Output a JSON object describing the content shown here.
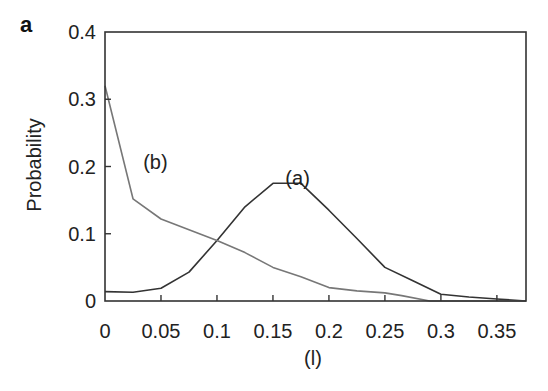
{
  "panel_label": "a",
  "chart_data": {
    "type": "line",
    "title": "",
    "panel": "a",
    "xlabel": "(l)",
    "ylabel": "Probability",
    "xlim": [
      0,
      0.376
    ],
    "ylim": [
      0,
      0.4
    ],
    "xticks": [
      0,
      0.05,
      0.1,
      0.15,
      0.2,
      0.25,
      0.3,
      0.35
    ],
    "xtick_labels": [
      "0",
      "0.05",
      "0.1",
      "0.15",
      "0.2",
      "0.25",
      "0.3",
      "0.35"
    ],
    "yticks": [
      0,
      0.1,
      0.2,
      0.3,
      0.4
    ],
    "ytick_labels": [
      "0",
      "0.1",
      "0.2",
      "0.3",
      "0.4"
    ],
    "grid": false,
    "legend": "none",
    "series": [
      {
        "name": "(a)",
        "color": "#333333",
        "label_pos": [
          0.172,
          0.183
        ],
        "x": [
          0,
          0.025,
          0.05,
          0.075,
          0.1,
          0.125,
          0.15,
          0.175,
          0.2,
          0.225,
          0.25,
          0.275,
          0.3,
          0.325,
          0.35,
          0.376
        ],
        "y": [
          0.014,
          0.013,
          0.019,
          0.043,
          0.09,
          0.14,
          0.175,
          0.175,
          0.135,
          0.093,
          0.05,
          0.03,
          0.01,
          0.006,
          0.003,
          0.0
        ]
      },
      {
        "name": "(b)",
        "color": "#777777",
        "label_pos": [
          0.045,
          0.207
        ],
        "x": [
          0,
          0.025,
          0.05,
          0.075,
          0.1,
          0.125,
          0.15,
          0.175,
          0.2,
          0.225,
          0.25,
          0.265,
          0.29,
          0.376
        ],
        "y": [
          0.32,
          0.152,
          0.122,
          0.106,
          0.09,
          0.072,
          0.05,
          0.036,
          0.02,
          0.015,
          0.012,
          0.008,
          0.0,
          0.0
        ]
      }
    ]
  }
}
